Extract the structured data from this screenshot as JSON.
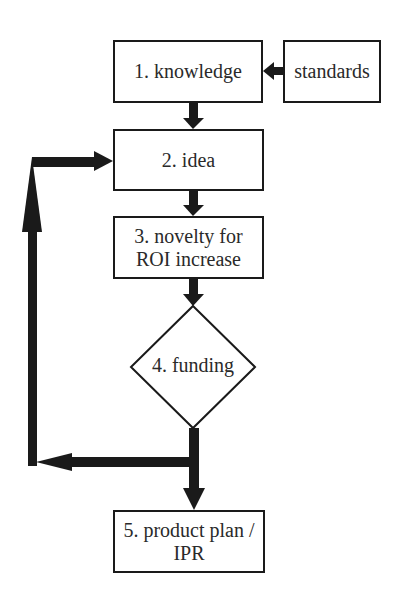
{
  "diagram": {
    "nodes": {
      "knowledge": {
        "label": "1. knowledge",
        "shape": "rectangle"
      },
      "standards": {
        "label": "standards",
        "shape": "rectangle"
      },
      "idea": {
        "label": "2. idea",
        "shape": "rectangle"
      },
      "novelty": {
        "line1": "3. novelty for",
        "line2": "ROI increase",
        "shape": "rectangle"
      },
      "funding": {
        "label": "4. funding",
        "shape": "diamond"
      },
      "product_plan": {
        "line1": "5. product plan /",
        "line2": "IPR",
        "shape": "rectangle"
      }
    },
    "edges": [
      {
        "from": "standards",
        "to": "knowledge"
      },
      {
        "from": "knowledge",
        "to": "idea"
      },
      {
        "from": "idea",
        "to": "novelty"
      },
      {
        "from": "novelty",
        "to": "funding"
      },
      {
        "from": "funding",
        "to": "product_plan"
      },
      {
        "from": "funding",
        "to": "idea",
        "note": "feedback loop via left side"
      }
    ],
    "colors": {
      "stroke": "#1a1a1a",
      "text": "#2a2a2a",
      "background": "#ffffff"
    }
  }
}
